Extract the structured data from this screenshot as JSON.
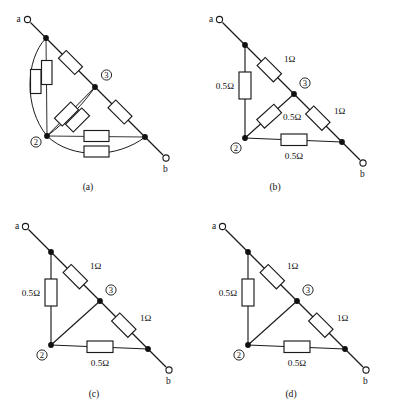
{
  "figure": {
    "panel_count": 4,
    "colors": {
      "ink": "#1b1b1b",
      "paper": "#ffffff",
      "node_fill": "#111111"
    }
  },
  "labels": {
    "terminal_a": "a",
    "terminal_b": "b",
    "node2": "2",
    "node3": "3",
    "ohm_half": "0.5Ω",
    "ohm_one": "1Ω"
  },
  "panels": [
    {
      "id": "a",
      "caption": "(a)",
      "description": "original network with parallel duplicated resistors and curved connecting wires",
      "terminals": [
        "a",
        "b"
      ],
      "nodes": [
        "2",
        "3"
      ],
      "resistor_values_shown": [],
      "has_value_labels": false,
      "resistor_count": 8
    },
    {
      "id": "b",
      "caption": "(b)",
      "description": "triangular network, vertical 0.5 ohm, upper diagonal 1 ohm, node2-node3 diagonal 0.5 ohm, node3-b 1 ohm, bottom 0.5 ohm",
      "terminals": [
        "a",
        "b"
      ],
      "nodes": [
        "2",
        "3"
      ],
      "has_value_labels": true,
      "resistors": [
        {
          "name": "vertical-a-to-node2",
          "value": "0.5Ω",
          "label_side": "left"
        },
        {
          "name": "diagonal-a-to-node3",
          "value": "1Ω",
          "label_side": "right"
        },
        {
          "name": "diagonal-node2-to-node3",
          "value": "0.5Ω",
          "label_side": "right"
        },
        {
          "name": "diagonal-node3-to-b",
          "value": "1Ω",
          "label_side": "right"
        },
        {
          "name": "bottom-node2-to-b",
          "value": "0.5Ω",
          "label_side": "below"
        }
      ]
    },
    {
      "id": "c",
      "caption": "(c)",
      "description": "triangular network, vertical 0.5 ohm, upper diagonal 1 ohm, plain wire node2-node3, node3-b 1 ohm, bottom 0.5 ohm",
      "terminals": [
        "a",
        "b"
      ],
      "nodes": [
        "2",
        "3"
      ],
      "has_value_labels": true,
      "resistors": [
        {
          "name": "vertical-a-to-node2",
          "value": "0.5Ω",
          "label_side": "left"
        },
        {
          "name": "diagonal-a-to-node3",
          "value": "1Ω",
          "label_side": "right"
        },
        {
          "name": "diagonal-node3-to-b",
          "value": "1Ω",
          "label_side": "right"
        },
        {
          "name": "bottom-node2-to-b",
          "value": "0.5Ω",
          "label_side": "below"
        }
      ]
    },
    {
      "id": "d",
      "caption": "(d)",
      "description": "triangular network, vertical 0.5 ohm, upper diagonal 1 ohm, plain wire node2-node3, node3-b 1 ohm, bottom 0.5 ohm",
      "terminals": [
        "a",
        "b"
      ],
      "nodes": [
        "2",
        "3"
      ],
      "has_value_labels": true,
      "resistors": [
        {
          "name": "vertical-a-to-node2",
          "value": "0.5Ω",
          "label_side": "left"
        },
        {
          "name": "diagonal-a-to-node3",
          "value": "1Ω",
          "label_side": "right"
        },
        {
          "name": "diagonal-node3-to-b",
          "value": "1Ω",
          "label_side": "right"
        },
        {
          "name": "bottom-node2-to-b",
          "value": "0.5Ω",
          "label_side": "below"
        }
      ]
    }
  ]
}
